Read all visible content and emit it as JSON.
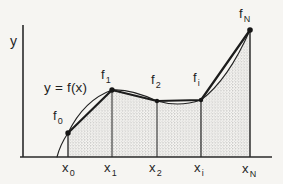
{
  "figure": {
    "title_hint": "Trapezoidal approximation of the area under y = f(x)",
    "colors": {
      "background": "#f6f5f2",
      "ink": "#222222",
      "stipple_dot": "#8f8f8f"
    },
    "y_axis_label": "y",
    "curve_label": "y = f(x)",
    "points": [
      {
        "f_base": "f",
        "f_sub": "0",
        "x_base": "x",
        "x_sub": "0"
      },
      {
        "f_base": "f",
        "f_sub": "1",
        "x_base": "x",
        "x_sub": "1"
      },
      {
        "f_base": "f",
        "f_sub": "2",
        "x_base": "x",
        "x_sub": "2"
      },
      {
        "f_base": "f",
        "f_sub": "i",
        "x_base": "x",
        "x_sub": "i"
      },
      {
        "f_base": "f",
        "f_sub": "N",
        "x_base": "x",
        "x_sub": "N"
      }
    ]
  }
}
